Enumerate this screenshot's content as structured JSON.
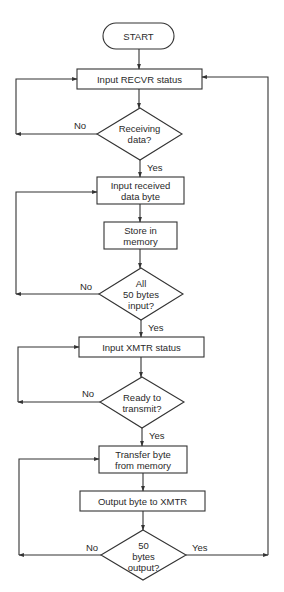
{
  "diagram": {
    "type": "flowchart",
    "stroke_color": "#333333",
    "background": "#ffffff",
    "nodes": {
      "start": {
        "shape": "terminator",
        "label": "START"
      },
      "input_recvr_status": {
        "shape": "process",
        "label": "Input RECVR status"
      },
      "receiving_data": {
        "shape": "decision",
        "line1": "Receiving",
        "line2": "data?"
      },
      "input_received_byte": {
        "shape": "process",
        "line1": "Input received",
        "line2": "data byte"
      },
      "store_in_memory": {
        "shape": "process",
        "line1": "Store in",
        "line2": "memory"
      },
      "all_50_input": {
        "shape": "decision",
        "line1": "All",
        "line2": "50 bytes",
        "line3": "input?"
      },
      "input_xmtr_status": {
        "shape": "process",
        "label": "Input XMTR status"
      },
      "ready_to_transmit": {
        "shape": "decision",
        "line1": "Ready to",
        "line2": "transmit?"
      },
      "transfer_byte": {
        "shape": "process",
        "line1": "Transfer byte",
        "line2": "from memory"
      },
      "output_byte": {
        "shape": "process",
        "label": "Output byte to XMTR"
      },
      "bytes_50_output": {
        "shape": "decision",
        "line1": "50",
        "line2": "bytes",
        "line3": "output?"
      }
    },
    "edge_labels": {
      "receiving_no": "No",
      "receiving_yes": "Yes",
      "all50_no": "No",
      "all50_yes": "Yes",
      "ready_no": "No",
      "ready_yes": "Yes",
      "output_no": "No",
      "output_yes": "Yes"
    },
    "edges": [
      {
        "from": "start",
        "to": "input_recvr_status"
      },
      {
        "from": "input_recvr_status",
        "to": "receiving_data"
      },
      {
        "from": "receiving_data",
        "to": "input_recvr_status",
        "label": "No"
      },
      {
        "from": "receiving_data",
        "to": "input_received_byte",
        "label": "Yes"
      },
      {
        "from": "input_received_byte",
        "to": "store_in_memory"
      },
      {
        "from": "store_in_memory",
        "to": "all_50_input"
      },
      {
        "from": "all_50_input",
        "to": "input_received_byte",
        "label": "No"
      },
      {
        "from": "all_50_input",
        "to": "input_xmtr_status",
        "label": "Yes"
      },
      {
        "from": "input_xmtr_status",
        "to": "ready_to_transmit"
      },
      {
        "from": "ready_to_transmit",
        "to": "input_xmtr_status",
        "label": "No"
      },
      {
        "from": "ready_to_transmit",
        "to": "transfer_byte",
        "label": "Yes"
      },
      {
        "from": "transfer_byte",
        "to": "output_byte"
      },
      {
        "from": "output_byte",
        "to": "bytes_50_output"
      },
      {
        "from": "bytes_50_output",
        "to": "transfer_byte",
        "label": "No"
      },
      {
        "from": "bytes_50_output",
        "to": "input_recvr_status",
        "label": "Yes"
      }
    ]
  }
}
